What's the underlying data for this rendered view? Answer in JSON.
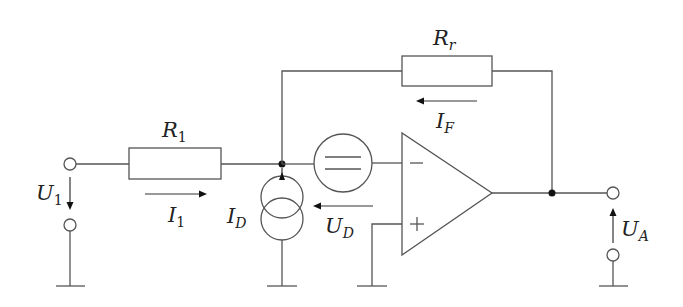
{
  "diagram": {
    "type": "circuit-schematic",
    "components": {
      "R1": {
        "label": "R",
        "subscript": "1",
        "subscript_italic": false,
        "kind": "resistor"
      },
      "Rr": {
        "label": "R",
        "subscript": "r",
        "subscript_italic": true,
        "kind": "resistor"
      },
      "UD_source": {
        "kind": "voltage-source"
      },
      "ID_source": {
        "kind": "current-source"
      },
      "opamp": {
        "kind": "operational-amplifier",
        "minus": "−",
        "plus": "+"
      }
    },
    "labels": {
      "U1": {
        "main": "U",
        "sub": "1",
        "sub_italic": false
      },
      "I1": {
        "main": "I",
        "sub": "1",
        "sub_italic": false
      },
      "ID": {
        "main": "I",
        "sub": "D",
        "sub_italic": true
      },
      "UD": {
        "main": "U",
        "sub": "D",
        "sub_italic": true
      },
      "IF": {
        "main": "I",
        "sub": "F",
        "sub_italic": true
      },
      "UA": {
        "main": "U",
        "sub": "A",
        "sub_italic": true
      }
    },
    "colors": {
      "wire": "#555555",
      "junction": "#111111",
      "text": "#222222",
      "background": "#ffffff"
    }
  }
}
